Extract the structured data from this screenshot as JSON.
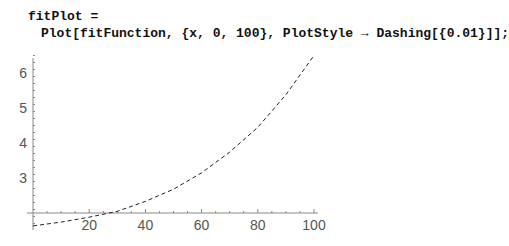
{
  "input_cell": {
    "line1": "fitPlot =",
    "line2": "Plot[fitFunction, {x, 0, 100}, PlotStyle → Dashing[{0.01}]];"
  },
  "chart_data": {
    "type": "line",
    "title": "",
    "xlabel": "",
    "ylabel": "",
    "xlim": [
      0,
      100
    ],
    "ylim": [
      1.6,
      6.6
    ],
    "axes_origin": [
      0,
      2
    ],
    "x_ticks": [
      "20",
      "40",
      "60",
      "80",
      "100"
    ],
    "y_ticks": [
      "3",
      "4",
      "5",
      "6"
    ],
    "line_style": "dashed",
    "grid": false,
    "series": [
      {
        "name": "fitFunction",
        "x": [
          0,
          10,
          20,
          30,
          40,
          50,
          60,
          70,
          80,
          90,
          100
        ],
        "values": [
          1.63,
          1.74,
          1.88,
          2.05,
          2.33,
          2.68,
          3.15,
          3.74,
          4.45,
          5.38,
          6.5
        ]
      }
    ]
  }
}
